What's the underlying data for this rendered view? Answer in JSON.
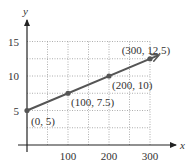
{
  "chart_data": {
    "type": "line",
    "title": "",
    "xlabel": "x",
    "ylabel": "y",
    "xlim": [
      0,
      300
    ],
    "ylim": [
      0,
      15
    ],
    "grid": true,
    "x_ticks": [
      100,
      200,
      300
    ],
    "y_ticks": [
      5,
      10,
      15
    ],
    "series": [
      {
        "name": "line",
        "x": [
          0,
          100,
          200,
          300
        ],
        "y": [
          5,
          7.5,
          10,
          12.5
        ],
        "arrow_end": true
      }
    ],
    "annotations": [
      {
        "x": 0,
        "y": 5,
        "text": "(0, 5)"
      },
      {
        "x": 100,
        "y": 7.5,
        "text": "(100, 7.5)"
      },
      {
        "x": 200,
        "y": 10,
        "text": "(200, 10)"
      },
      {
        "x": 300,
        "y": 12.5,
        "text": "(300, 12.5)"
      }
    ],
    "colors": {
      "line": "#555555",
      "axis": "#222222",
      "grid": "#999999"
    }
  }
}
